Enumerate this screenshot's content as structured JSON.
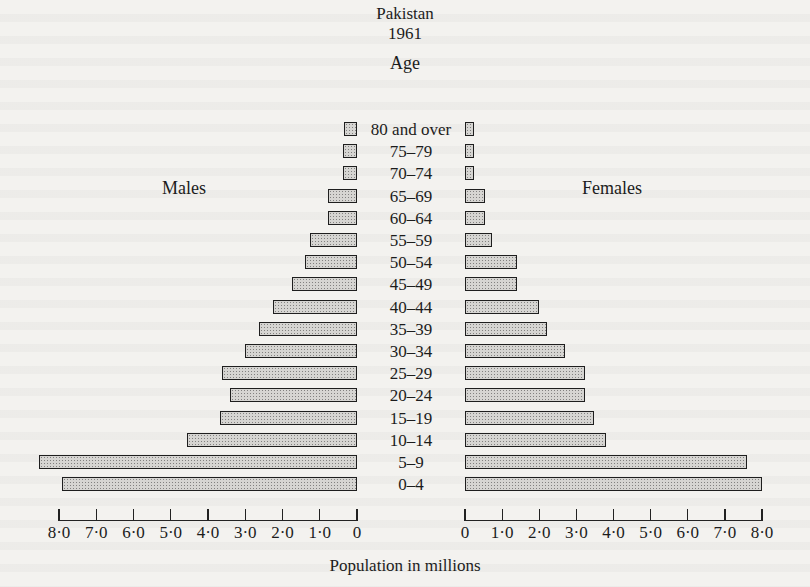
{
  "title": "Pakistan",
  "subtitle": "1961",
  "age_heading": "Age",
  "males_label": "Males",
  "females_label": "Females",
  "xlabel": "Population in millions",
  "male_ticks": [
    "8·0",
    "7·0",
    "6·0",
    "5·0",
    "4·0",
    "3·0",
    "2·0",
    "1·0",
    "0"
  ],
  "female_ticks": [
    "0",
    "1·0",
    "2·0",
    "3·0",
    "4·0",
    "5·0",
    "6·0",
    "7·0",
    "8·0"
  ],
  "chart_data": {
    "type": "bar",
    "orientation": "horizontal",
    "subtype": "population pyramid",
    "ylabel": "Age",
    "xlabel": "Population in millions",
    "xlim": [
      0,
      8.0
    ],
    "x_ticks": [
      0,
      1.0,
      2.0,
      3.0,
      4.0,
      5.0,
      6.0,
      7.0,
      8.0
    ],
    "grid": false,
    "legend": "none (Males label left, Females label right)",
    "categories": [
      "80 and over",
      "75–79",
      "70–74",
      "65–69",
      "60–64",
      "55–59",
      "50–54",
      "45–49",
      "40–44",
      "35–39",
      "30–34",
      "25–29",
      "20–24",
      "15–19",
      "10–14",
      "5–9",
      "0–4"
    ],
    "series": [
      {
        "name": "Males",
        "side": "left",
        "values": [
          0.35,
          0.38,
          0.38,
          0.78,
          0.78,
          1.27,
          1.4,
          1.75,
          2.26,
          2.64,
          3.02,
          3.64,
          3.42,
          3.69,
          4.58,
          8.57,
          7.95
        ]
      },
      {
        "name": "Females",
        "side": "right",
        "values": [
          0.25,
          0.25,
          0.25,
          0.54,
          0.54,
          0.73,
          1.41,
          1.41,
          2.0,
          2.2,
          2.7,
          3.24,
          3.24,
          3.49,
          3.81,
          7.6,
          8.0
        ]
      }
    ]
  }
}
